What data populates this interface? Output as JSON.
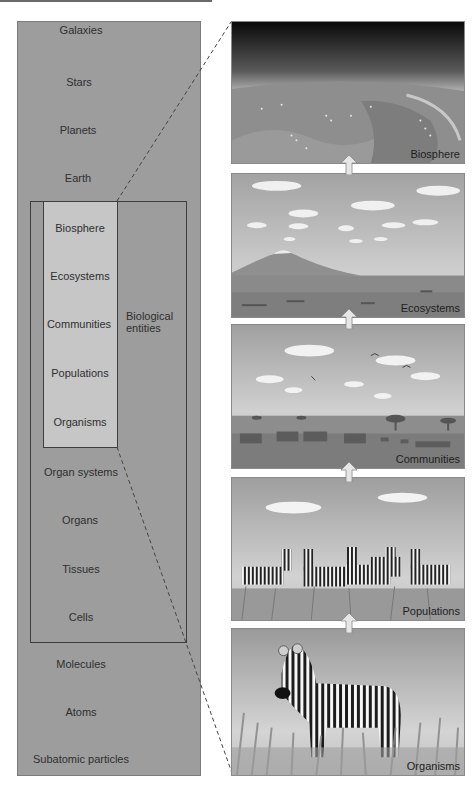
{
  "left_scale": {
    "levels": [
      {
        "label": "Galaxies",
        "x": 81,
        "y": 24
      },
      {
        "label": "Stars",
        "x": 79,
        "y": 76
      },
      {
        "label": "Planets",
        "x": 78,
        "y": 124
      },
      {
        "label": "Earth",
        "x": 78,
        "y": 172
      },
      {
        "label": "Organ systems",
        "x": 81,
        "y": 466
      },
      {
        "label": "Organs",
        "x": 80,
        "y": 514
      },
      {
        "label": "Tissues",
        "x": 81,
        "y": 563
      },
      {
        "label": "Cells",
        "x": 81,
        "y": 611
      },
      {
        "label": "Molecules",
        "x": 81,
        "y": 658
      },
      {
        "label": "Atoms",
        "x": 81,
        "y": 706
      },
      {
        "label": "Subatomic particles",
        "x": 81,
        "y": 753
      }
    ],
    "biological_levels": [
      {
        "label": "Biosphere",
        "x": 80,
        "y": 222
      },
      {
        "label": "Ecosystems",
        "x": 80,
        "y": 270
      },
      {
        "label": "Communities",
        "x": 79,
        "y": 318
      },
      {
        "label": "Populations",
        "x": 80,
        "y": 367
      },
      {
        "label": "Organisms",
        "x": 80,
        "y": 416
      }
    ],
    "group_label_line1": "Biological",
    "group_label_line2": "entities"
  },
  "panels": [
    {
      "label": "Biosphere",
      "top": 21,
      "height": 143,
      "scene": "earth-from-space"
    },
    {
      "label": "Ecosystems",
      "top": 173,
      "height": 145,
      "scene": "savanna-landscape"
    },
    {
      "label": "Communities",
      "top": 324,
      "height": 145,
      "scene": "savanna-animals"
    },
    {
      "label": "Populations",
      "top": 477,
      "height": 144,
      "scene": "zebra-herd"
    },
    {
      "label": "Organisms",
      "top": 628,
      "height": 148,
      "scene": "single-zebra"
    }
  ],
  "colors": {
    "panel_bg": "#9d9d9d",
    "bio_column": "#c6c6c6",
    "border": "#3e3e3e",
    "sky": "#a9a9a9",
    "arrow": "#e6e6e6"
  }
}
